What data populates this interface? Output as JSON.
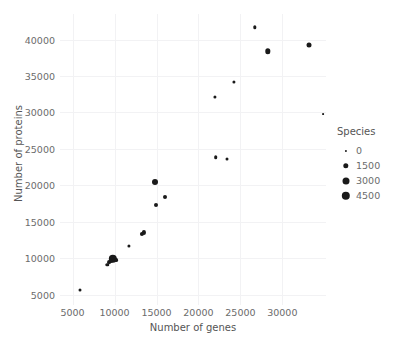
{
  "chart_data": {
    "type": "scatter",
    "title": "",
    "xlabel": "Number of genes",
    "ylabel": "Number of proteins",
    "xlim": [
      3500,
      35200
    ],
    "ylim": [
      3600,
      43500
    ],
    "xticks": [
      5000,
      10000,
      15000,
      20000,
      25000,
      30000
    ],
    "xticklabels": [
      "5000",
      "10000",
      "15000",
      "20000",
      "25000",
      "30000"
    ],
    "yticks": [
      5000,
      10000,
      15000,
      20000,
      25000,
      30000,
      35000,
      40000
    ],
    "yticklabels": [
      "5000",
      "10000",
      "15000",
      "20000",
      "25000",
      "30000",
      "35000",
      "40000"
    ],
    "grid": true,
    "size_encoding": "Species",
    "legend": {
      "title": "Species",
      "position": "right",
      "entries": [
        {
          "label": "0",
          "value": 0,
          "marker_px": 2.2
        },
        {
          "label": "1500",
          "value": 1500,
          "marker_px": 5.4
        },
        {
          "label": "3000",
          "value": 3000,
          "marker_px": 7.0
        },
        {
          "label": "4500",
          "value": 4500,
          "marker_px": 8.4
        }
      ]
    },
    "points": [
      {
        "x": 5900,
        "y": 5700,
        "size": 120,
        "marker_px": 3.0
      },
      {
        "x": 9150,
        "y": 9100,
        "size": 200,
        "marker_px": 3.4
      },
      {
        "x": 9350,
        "y": 9450,
        "size": 300,
        "marker_px": 3.8
      },
      {
        "x": 9600,
        "y": 9700,
        "size": 400,
        "marker_px": 4.0
      },
      {
        "x": 9800,
        "y": 9950,
        "size": 4600,
        "marker_px": 8.4
      },
      {
        "x": 9950,
        "y": 9900,
        "size": 900,
        "marker_px": 5.0
      },
      {
        "x": 10200,
        "y": 9800,
        "size": 350,
        "marker_px": 3.8
      },
      {
        "x": 11700,
        "y": 11650,
        "size": 200,
        "marker_px": 3.2
      },
      {
        "x": 13250,
        "y": 13300,
        "size": 500,
        "marker_px": 4.2
      },
      {
        "x": 13500,
        "y": 13550,
        "size": 500,
        "marker_px": 4.2
      },
      {
        "x": 14800,
        "y": 20500,
        "size": 1600,
        "marker_px": 6.0
      },
      {
        "x": 14900,
        "y": 17300,
        "size": 400,
        "marker_px": 4.0
      },
      {
        "x": 16050,
        "y": 18350,
        "size": 400,
        "marker_px": 4.0
      },
      {
        "x": 22000,
        "y": 32150,
        "size": 200,
        "marker_px": 3.2
      },
      {
        "x": 22050,
        "y": 23850,
        "size": 300,
        "marker_px": 3.6
      },
      {
        "x": 23450,
        "y": 23650,
        "size": 200,
        "marker_px": 3.0
      },
      {
        "x": 24200,
        "y": 34200,
        "size": 200,
        "marker_px": 3.2
      },
      {
        "x": 26700,
        "y": 41650,
        "size": 250,
        "marker_px": 3.4
      },
      {
        "x": 28300,
        "y": 38400,
        "size": 1100,
        "marker_px": 5.4
      },
      {
        "x": 33200,
        "y": 39200,
        "size": 900,
        "marker_px": 5.0
      },
      {
        "x": 34900,
        "y": 29750,
        "size": 60,
        "marker_px": 1.8
      }
    ]
  },
  "colors": {
    "marker": "#1a1a1a",
    "grid": "#f2f2f4",
    "tick_text": "#6b6b6b",
    "axis_title": "#555555",
    "background": "#ffffff"
  }
}
